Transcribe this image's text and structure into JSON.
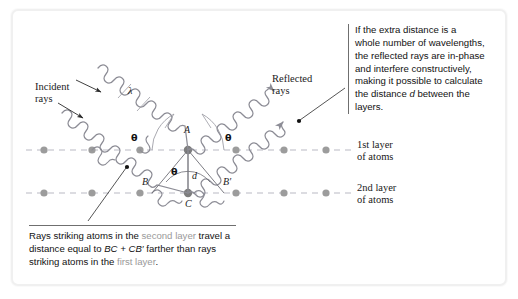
{
  "figure": {
    "type": "physics-diagram"
  },
  "diagram_labels": {
    "incident_rays": "Incident\nrays",
    "reflected_rays": "Reflected\nrays",
    "layer1": "1st layer\nof atoms",
    "layer2": "2nd layer\nof atoms",
    "wavelength_symbol": "λ",
    "theta_symbol": "θ",
    "point_a": "A",
    "point_b": "B",
    "point_b_prime": "B′",
    "point_c": "C",
    "distance_d": "d"
  },
  "callout": {
    "lines": [
      "If the extra distance is a",
      "whole number of wavelengths,",
      "the reflected rays are in-phase",
      "and interfere constructively,",
      "making it possible to calculate",
      "the distance d between the",
      "layers."
    ],
    "text": "If the extra distance is a whole number of wavelengths, the reflected rays are in-phase and interfere constructively, making it possible to calculate the distance d between the layers.",
    "italic_term": "d"
  },
  "caption": {
    "text": "Rays striking atoms in the second layer travel a distance equal to BC + CB′ farther than rays striking atoms in the first layer.",
    "segments": [
      {
        "t": "Rays striking atoms in the ",
        "style": "plain"
      },
      {
        "t": "second",
        "style": "gray"
      },
      {
        "t": " ",
        "style": "plain"
      },
      {
        "t": "layer",
        "style": "gray"
      },
      {
        "t": " travel a distance equal to ",
        "style": "plain"
      },
      {
        "t": "BC + CB′",
        "style": "italic"
      },
      {
        "t": " farther than rays striking atoms in the ",
        "style": "plain"
      },
      {
        "t": "first layer",
        "style": "gray"
      },
      {
        "t": ".",
        "style": "plain"
      }
    ]
  },
  "colors": {
    "atom": "#9c9c9c",
    "atom_dark": "#7d7d7d",
    "wave": "#8d8d96",
    "lattice_line": "#b9b9c4",
    "geometry_line": "#6e6e76",
    "frame": "#f0f0f0",
    "gray_text": "#9a9a9a",
    "text": "#1a1a1a"
  },
  "geometry": {
    "layer1_y": 150,
    "layer2_y": 193,
    "spacing_d": 43,
    "atom_row1_x": [
      44,
      92,
      140,
      188,
      236,
      284,
      326
    ],
    "atom_row2_x": [
      44,
      92,
      140,
      188,
      236,
      284,
      326
    ],
    "vertex_a": [
      188,
      150
    ],
    "vertex_c": [
      188,
      193
    ],
    "vertex_b": [
      152,
      193
    ],
    "vertex_b_prime": [
      224,
      193
    ],
    "angle_theta_deg": 55
  }
}
